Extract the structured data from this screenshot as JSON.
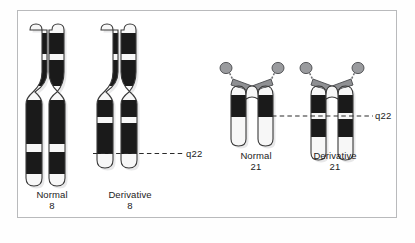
{
  "figure": {
    "background_color": "#ffffff",
    "frame_color": "#b9babc",
    "band_dark_color": "#1a1a1a",
    "band_light_color": "#f7f7f7",
    "outline_color": "#3a3a3a",
    "centromere_color": "#8f9093",
    "satellite_color": "#9a9b9e",
    "shadow_color": "#c9cacc",
    "label_color": "#1b1b1b"
  },
  "chromosomes": [
    {
      "id": "normal-8",
      "name_line1": "Normal",
      "name_line2": "8",
      "type": "metacentric",
      "bands": [
        "light",
        "dark",
        "light",
        "dark",
        "light",
        "dark",
        "light",
        "dark",
        "light"
      ]
    },
    {
      "id": "derivative-8",
      "name_line1": "Derivative",
      "name_line2": "8",
      "type": "metacentric",
      "bands": [
        "light",
        "dark",
        "light",
        "dark",
        "light",
        "dark",
        "light"
      ]
    },
    {
      "id": "normal-21",
      "name_line1": "Normal",
      "name_line2": "21",
      "type": "acrocentric",
      "bands": [
        "dark",
        "light"
      ]
    },
    {
      "id": "derivative-21",
      "name_line1": "Derivative",
      "name_line2": "21",
      "type": "acrocentric",
      "bands": [
        "dark",
        "light",
        "dark",
        "light"
      ]
    }
  ],
  "breakpoint_labels": {
    "chr8": "q22",
    "chr21": "q22"
  }
}
